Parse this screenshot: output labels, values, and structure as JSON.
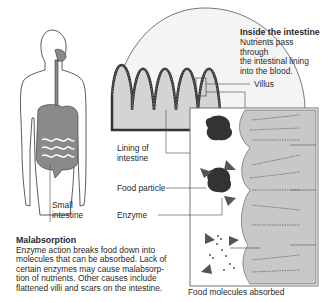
{
  "diagram": {
    "title": "Inside the intestine",
    "subtitle": "Nutrients pass through the intestinal lining into the blood.",
    "subtitle_lines": [
      "Nutrients pass through",
      "the intestinal lining",
      "into the blood."
    ],
    "labels": {
      "small_intestine": [
        "Small",
        "intestine"
      ],
      "villus": "Villus",
      "lining": [
        "Lining of",
        "intestine"
      ],
      "food_particle": "Food particle",
      "enzyme": "Enzyme",
      "food_molecules": "Food molecules absorbed"
    },
    "malabsorption": {
      "heading": "Malabsorption",
      "lines": [
        "Enzyme action breaks food down into",
        "molecules that can be absorbed. Lack of",
        "certain enzymes may cause malabsorp-",
        "tion of nutrients. Other causes include",
        "flattened villi and scars on the intestine."
      ]
    },
    "colors": {
      "organ_fill": "#8a8a8a",
      "lining_fill": "#c8c8c8",
      "particle_fill": "#333333",
      "line": "#444444"
    }
  }
}
